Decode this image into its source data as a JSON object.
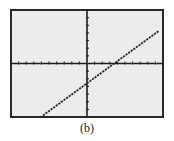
{
  "caption": "(b)",
  "colors": {
    "frame": "#2a2a2a",
    "screen_bg": "#ececea",
    "axis": "#1e1e1e",
    "line": "#2a2a2a"
  },
  "chart_data": {
    "type": "line",
    "title": "",
    "xlabel": "",
    "ylabel": "",
    "grid": false,
    "xlim": [
      -10,
      10
    ],
    "ylim": [
      -7,
      7
    ],
    "x_ticks_per_side": 10,
    "y_ticks_per_side": 7,
    "series": [
      {
        "name": "line",
        "style": "dotted",
        "x": [
          -5.8,
          9.5
        ],
        "y": [
          -6.8,
          4.3
        ]
      }
    ],
    "x_intercept": 3.7,
    "y_intercept": -2.7
  }
}
